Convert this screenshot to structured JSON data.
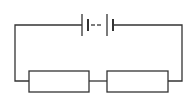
{
  "diagram": {
    "type": "circuit",
    "stroke_color": "#333333",
    "background": "#ffffff",
    "components": [
      {
        "id": "battery",
        "kind": "battery",
        "cells": "multiple (dashed between)"
      },
      {
        "id": "resistor-1",
        "kind": "resistor"
      },
      {
        "id": "resistor-2",
        "kind": "resistor"
      }
    ]
  }
}
